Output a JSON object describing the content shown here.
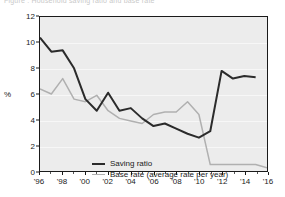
{
  "figure": {
    "clipped_title": "Figure : Household saving ratio and base rate",
    "background_color": "#ffffff",
    "plot_background_color": "#ececec",
    "frame_color": "#1a1a1a"
  },
  "chart_data": {
    "type": "line",
    "title": "",
    "xlabel": "",
    "ylabel": "%",
    "ylim": [
      0,
      12
    ],
    "xlim": [
      1996,
      2016
    ],
    "yticks": [
      0,
      2,
      4,
      6,
      8,
      10,
      12
    ],
    "ytick_labels": [
      "0",
      "2",
      "4",
      "6",
      "8",
      "10",
      "12"
    ],
    "xticks": [
      1996,
      1998,
      2000,
      2002,
      2004,
      2006,
      2008,
      2010,
      2012,
      2014,
      2016
    ],
    "xtick_labels": [
      "'96",
      "'98",
      "'00",
      "'02",
      "'04",
      "'06",
      "'08",
      "'10",
      "'12",
      "'14",
      "'16"
    ],
    "grid": true,
    "grid_axis": "y",
    "legend_position": "lower-left-inside",
    "x": [
      1996,
      1997,
      1998,
      1999,
      2000,
      2001,
      2002,
      2003,
      2004,
      2005,
      2006,
      2007,
      2008,
      2009,
      2010,
      2011,
      2012,
      2013,
      2014,
      2015,
      2016
    ],
    "series": [
      {
        "name": "Saving ratio",
        "color": "#2b2b2b",
        "line_width": 2,
        "values": [
          10.4,
          9.3,
          9.4,
          8.0,
          5.6,
          4.7,
          6.1,
          4.7,
          4.9,
          4.1,
          3.5,
          3.7,
          3.3,
          2.9,
          2.6,
          3.1,
          7.8,
          7.2,
          7.4,
          7.3,
          null
        ],
        "values_by_year": [
          {
            "year": 1996,
            "value": 10.4
          },
          {
            "year": 1997,
            "value": 9.3
          },
          {
            "year": 1998,
            "value": 9.4
          },
          {
            "year": 1999,
            "value": 7.6
          },
          {
            "year": 2000,
            "value": 5.4
          },
          {
            "year": 2001,
            "value": 4.7
          },
          {
            "year": 2002,
            "value": 6.1
          },
          {
            "year": 2003,
            "value": 4.7
          },
          {
            "year": 2004,
            "value": 4.9
          },
          {
            "year": 2005,
            "value": 4.1
          },
          {
            "year": 2006,
            "value": 3.5
          },
          {
            "year": 2007,
            "value": 3.7
          },
          {
            "year": 2008,
            "value": 3.3
          },
          {
            "year": 2009,
            "value": 2.9
          },
          {
            "year": 2010,
            "value": 2.6
          },
          {
            "year": 2011,
            "value": 3.1
          },
          {
            "year": 2012,
            "value": 7.8
          },
          {
            "year": 2013,
            "value": 7.2
          },
          {
            "year": 2014,
            "value": 7.4
          },
          {
            "year": 2015,
            "value": 7.3
          },
          {
            "year": 2016,
            "value": 4.2
          }
        ]
      },
      {
        "name": "Base rate (average rate per year)",
        "color": "#b0b0b0",
        "line_width": 1.5,
        "values": [
          6.4,
          6.0,
          7.2,
          5.6,
          5.4,
          5.9,
          4.7,
          4.1,
          3.9,
          3.7,
          4.4,
          4.6,
          4.6,
          5.4,
          4.4,
          0.5,
          0.5,
          0.5,
          0.5,
          0.5,
          0.25
        ]
      }
    ],
    "legend": [
      {
        "label": "Saving ratio",
        "color": "#2b2b2b",
        "style": "thick-dark-line"
      },
      {
        "label": "Base rate (average rate per year)",
        "color": "#b0b0b0",
        "style": "thin-gray-line"
      }
    ]
  }
}
